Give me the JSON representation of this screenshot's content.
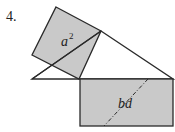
{
  "problem": {
    "number": "4."
  },
  "diagram": {
    "square_label": "a",
    "square_label_exponent": "2",
    "rectangle_label": "bd",
    "colors": {
      "fill": "#c9c9c9",
      "stroke": "#2a2a2a",
      "background": "#ffffff"
    }
  }
}
